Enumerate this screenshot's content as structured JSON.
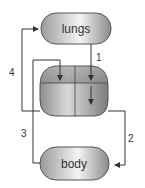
{
  "diagram": {
    "nodes": {
      "lungs": {
        "label": "lungs"
      },
      "body": {
        "label": "body"
      },
      "heart": {
        "label": ""
      }
    },
    "arrows": [
      {
        "label": "1",
        "from": "lungs",
        "to": "heart-right-chamber"
      },
      {
        "label": "2",
        "from": "heart",
        "to": "body"
      },
      {
        "label": "3",
        "from": "body",
        "to": "heart-left-chamber"
      },
      {
        "label": "4",
        "from": "heart",
        "to": "lungs"
      }
    ]
  }
}
